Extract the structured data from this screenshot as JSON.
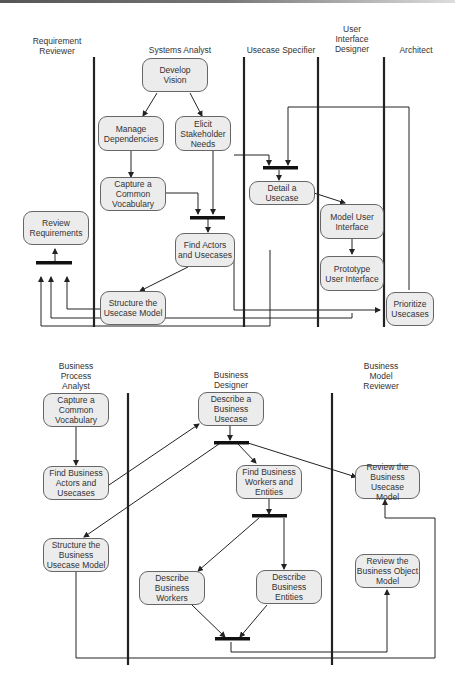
{
  "diagram_top": {
    "lanes": [
      {
        "id": "requirement-reviewer",
        "title": "Requirement\nReviewer"
      },
      {
        "id": "systems-analyst",
        "title": "Systems Analyst"
      },
      {
        "id": "usecase-specifier",
        "title": "Usecase Specifier"
      },
      {
        "id": "ui-designer",
        "title": "User\nInterface\nDesigner"
      },
      {
        "id": "architect",
        "title": "Architect"
      }
    ],
    "activities": [
      {
        "id": "develop-vision",
        "label": "Develop\nVision"
      },
      {
        "id": "manage-dependencies",
        "label": "Manage\nDependencies"
      },
      {
        "id": "elicit-stakeholder-needs",
        "label": "Elicit\nStakeholder\nNeeds"
      },
      {
        "id": "capture-common-vocabulary",
        "label": "Capture a\nCommon\nVocabulary"
      },
      {
        "id": "review-requirements",
        "label": "Review\nRequirements"
      },
      {
        "id": "find-actors-usecases",
        "label": "Find Actors\nand Usecases"
      },
      {
        "id": "structure-usecase-model",
        "label": "Structure the\nUsecase Model"
      },
      {
        "id": "detail-usecase",
        "label": "Detail a\nUsecase"
      },
      {
        "id": "model-user-interface",
        "label": "Model User\nInterface"
      },
      {
        "id": "prototype-user-interface",
        "label": "Prototype\nUser Interface"
      },
      {
        "id": "prioritize-usecases",
        "label": "Prioritize\nUsecases"
      }
    ]
  },
  "diagram_bottom": {
    "lanes": [
      {
        "id": "business-process-analyst",
        "title": "Business\nProcess\nAnalyst"
      },
      {
        "id": "business-designer",
        "title": "Business\nDesigner"
      },
      {
        "id": "business-model-reviewer",
        "title": "Business\nModel\nReviewer"
      }
    ],
    "activities": [
      {
        "id": "capture-common-vocabulary-b",
        "label": "Capture a\nCommon\nVocabulary"
      },
      {
        "id": "find-business-actors",
        "label": "Find Business\nActors and\nUsecases"
      },
      {
        "id": "structure-business-usecase-model",
        "label": "Structure the\nBusiness\nUsecase Model"
      },
      {
        "id": "describe-business-usecase",
        "label": "Describe a\nBusiness Usecase"
      },
      {
        "id": "find-business-workers-entities",
        "label": "Find Business\nWorkers and\nEntities"
      },
      {
        "id": "describe-business-workers",
        "label": "Describe\nBusiness\nWorkers"
      },
      {
        "id": "describe-business-entities",
        "label": "Describe\nBusiness\nEntities"
      },
      {
        "id": "review-business-usecase-model",
        "label": "Review the\nBusiness Usecase\nModel"
      },
      {
        "id": "review-business-object-model",
        "label": "Review the\nBusiness Object\nModel"
      }
    ]
  },
  "colors": {
    "node_fill": "#ececec",
    "node_border": "#666666",
    "line": "#222222",
    "bar": "#111111"
  }
}
